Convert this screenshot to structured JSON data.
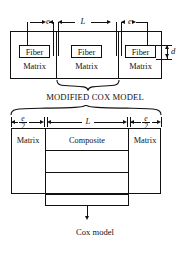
{
  "figure": {
    "top_diagram": {
      "dimension_labels": {
        "left_gap": "e",
        "center_span": "L",
        "right_gap": "e",
        "thickness": "d"
      },
      "cells": [
        {
          "fiber_label": "Fiber",
          "matrix_label": "Matrix"
        },
        {
          "fiber_label": "Fiber",
          "matrix_label": "Matrix"
        },
        {
          "fiber_label": "Fiber",
          "matrix_label": "Matrix"
        }
      ],
      "caption": "MODIFIED COX MODEL"
    },
    "bottom_diagram": {
      "dimension_labels": {
        "left_gap_numerator": "e",
        "left_gap_denominator": "2",
        "center_span": "L",
        "right_gap_numerator": "e",
        "right_gap_denominator": "2"
      },
      "regions": [
        {
          "label": "Matrix"
        },
        {
          "label": "Composite"
        },
        {
          "label": "Matrix"
        }
      ],
      "caption": "Cox model"
    },
    "colors": {
      "ink": "#111111",
      "paper": "#ffffff"
    }
  }
}
